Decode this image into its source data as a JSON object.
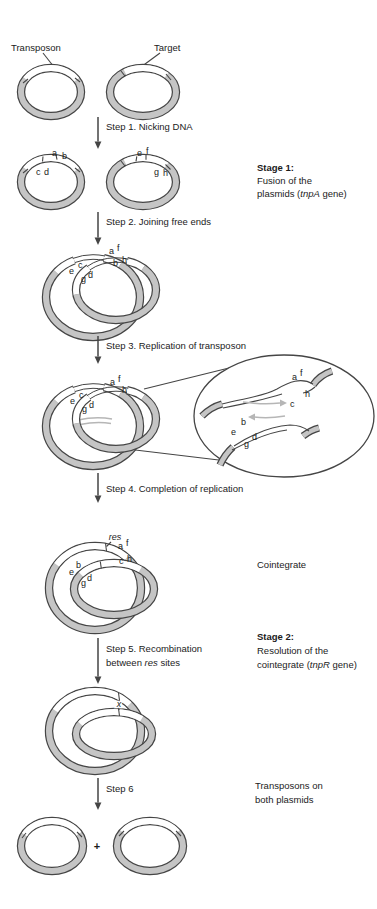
{
  "colors": {
    "outline": "#454545",
    "band": "#c5c5c5",
    "light": "#b6b6b6",
    "ink": "#1b1b1b",
    "bg": "#ffffff"
  },
  "labels": {
    "transposon": "Transposon",
    "target": "Target",
    "cointegrate": "Cointegrate",
    "plus": "+",
    "res": "res",
    "crossover": "x"
  },
  "letters": {
    "a": "a",
    "b": "b",
    "c": "c",
    "d": "d",
    "e": "e",
    "f": "f",
    "g": "g",
    "h": "h"
  },
  "steps": {
    "s1": "Step 1. Nicking DNA",
    "s2": "Step 2. Joining free ends",
    "s3": "Step 3. Replication of transposon",
    "s4": "Step 4. Completion of replication",
    "s5a": "Step 5. Recombination",
    "s5b_pre": "between ",
    "s5b_it": "res",
    "s5b_post": " sites",
    "s6": "Step 6"
  },
  "stage1": {
    "title": "Stage 1:",
    "line1": "Fusion of the",
    "line2_pre": "plasmids (",
    "line2_it": "tnpA",
    "line2_post": " gene)"
  },
  "stage2": {
    "title": "Stage 2:",
    "line1": "Resolution of the",
    "line2_pre": "cointegrate (",
    "line2_it": "tnpR",
    "line2_post": " gene)"
  },
  "result": {
    "line1": "Transposons on",
    "line2": "both plasmids"
  }
}
